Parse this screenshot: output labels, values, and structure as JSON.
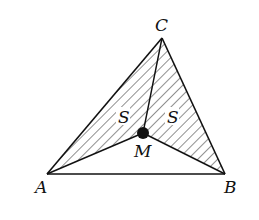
{
  "figure": {
    "type": "geometry-diagram",
    "points": {
      "A": {
        "label": "A",
        "x": 47,
        "y": 174
      },
      "B": {
        "label": "B",
        "x": 225,
        "y": 174
      },
      "C": {
        "label": "C",
        "x": 162,
        "y": 38
      },
      "M": {
        "label": "M",
        "x": 143,
        "y": 133
      }
    },
    "area_labels": [
      {
        "region": "AMC",
        "text": "S"
      },
      {
        "region": "BMC",
        "text": "S"
      }
    ],
    "colors": {
      "stroke": "#111111",
      "background": "#ffffff"
    }
  }
}
